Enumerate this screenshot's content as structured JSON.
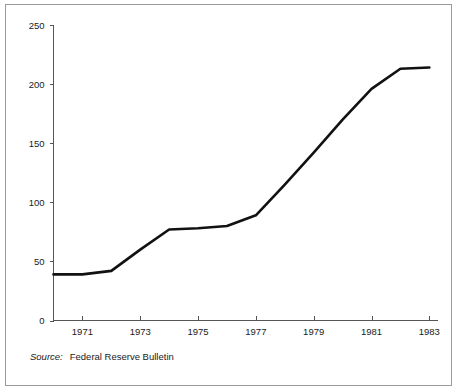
{
  "figure": {
    "source_label": "Source:",
    "source_text": "Federal Reserve Bulletin",
    "border_color": "#9a9a9a",
    "background_color": "#ffffff"
  },
  "chart_data": {
    "type": "line",
    "title": "",
    "subtitle": "",
    "xlabel": "",
    "ylabel": "",
    "x": [
      1970,
      1971,
      1972,
      1973,
      1974,
      1975,
      1976,
      1977,
      1978,
      1979,
      1980,
      1981,
      1982,
      1983
    ],
    "values": [
      39,
      39,
      42,
      60,
      77,
      78,
      80,
      89,
      115,
      142,
      170,
      196,
      213,
      214
    ],
    "series": [
      {
        "name": "series-1",
        "color": "#111111",
        "values": [
          39,
          39,
          42,
          60,
          77,
          78,
          80,
          89,
          115,
          142,
          170,
          196,
          213,
          214
        ]
      }
    ],
    "xlim": [
      1970,
      1983.3
    ],
    "ylim": [
      0,
      250
    ],
    "x_ticks": [
      1971,
      1973,
      1975,
      1977,
      1979,
      1981,
      1983
    ],
    "x_tick_labels": [
      "1971",
      "1973",
      "1975",
      "1977",
      "1979",
      "1981",
      "1983"
    ],
    "y_ticks": [
      0,
      50,
      100,
      150,
      200,
      250
    ],
    "y_tick_labels": [
      "0",
      "50",
      "100",
      "150",
      "200",
      "250"
    ],
    "grid": false,
    "legend": false,
    "legend_position": "none",
    "annotations": [
      "Source:  Federal Reserve Bulletin"
    ]
  }
}
